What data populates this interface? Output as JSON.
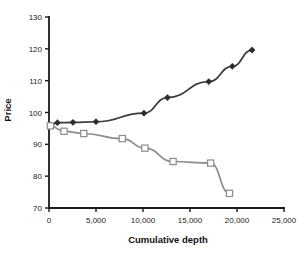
{
  "chart_data": {
    "type": "line",
    "title": "",
    "subtitle": "",
    "xlabel": "Cumulative depth",
    "ylabel": "Price",
    "xlim": [
      0,
      25000
    ],
    "ylim": [
      70,
      130
    ],
    "xticks": [
      0,
      5000,
      10000,
      15000,
      20000,
      25000
    ],
    "xticklabels": [
      "0",
      "5,000",
      "10,000",
      "15,000",
      "20,000",
      "25,000"
    ],
    "yticks": [
      70,
      80,
      90,
      100,
      110,
      120,
      130
    ],
    "yticklabels": [
      "70",
      "80",
      "90",
      "100",
      "110",
      "120",
      "130"
    ],
    "grid": false,
    "legend": "none",
    "series": [
      {
        "name": "ask",
        "marker": "filled-diamond",
        "color": "#3a3a3a",
        "marker_color": "#2e2e2e",
        "points": [
          {
            "x": 150,
            "y": 96.0
          },
          {
            "x": 900,
            "y": 96.8
          },
          {
            "x": 2550,
            "y": 96.9
          },
          {
            "x": 5000,
            "y": 97.1
          },
          {
            "x": 10100,
            "y": 99.8
          },
          {
            "x": 12600,
            "y": 104.7
          },
          {
            "x": 17000,
            "y": 109.7
          },
          {
            "x": 19500,
            "y": 114.5
          },
          {
            "x": 21600,
            "y": 119.6
          }
        ]
      },
      {
        "name": "bid",
        "marker": "open-square",
        "color": "#8c8c8c",
        "marker_color": "#8c8c8c",
        "points": [
          {
            "x": 150,
            "y": 95.8
          },
          {
            "x": 1600,
            "y": 94.1
          },
          {
            "x": 3700,
            "y": 93.4
          },
          {
            "x": 7800,
            "y": 91.8
          },
          {
            "x": 10200,
            "y": 88.8
          },
          {
            "x": 13200,
            "y": 84.6
          },
          {
            "x": 17200,
            "y": 84.1
          },
          {
            "x": 19200,
            "y": 74.6
          }
        ]
      }
    ]
  }
}
